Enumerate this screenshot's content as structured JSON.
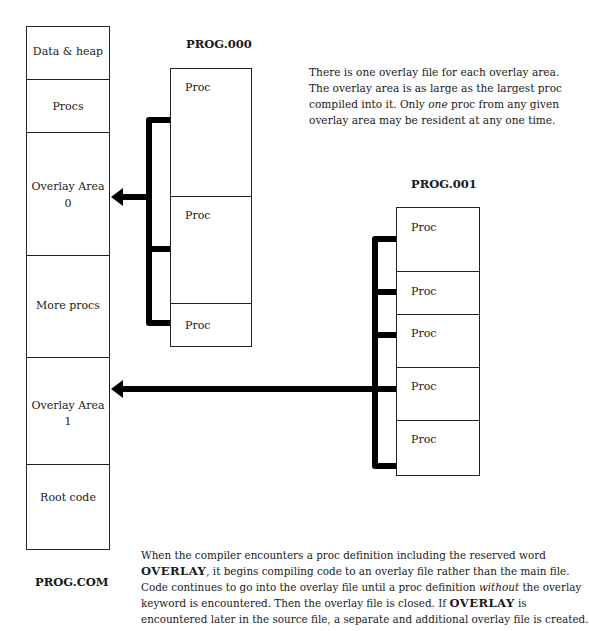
{
  "main_file": {
    "title": "PROG.COM",
    "segments": [
      {
        "label": "Data & heap"
      },
      {
        "label": "Procs"
      },
      {
        "label": "Overlay Area",
        "sub": "0"
      },
      {
        "label": "More procs"
      },
      {
        "label": "Overlay Area",
        "sub": "1"
      },
      {
        "label": "Root code"
      }
    ]
  },
  "overlay_files": [
    {
      "title": "PROG.000",
      "overlay_area": "0",
      "procs": [
        "Proc",
        "Proc",
        "Proc"
      ]
    },
    {
      "title": "PROG.001",
      "overlay_area": "1",
      "procs": [
        "Proc",
        "Proc",
        "Proc",
        "Proc",
        "Proc"
      ]
    }
  ],
  "note_top": {
    "lines": [
      "There is one overlay file for each overlay area.",
      "The overlay area is as large as the largest proc",
      "compiled into it.  Only ",
      "one",
      " proc from any given",
      "overlay area may be resident at any one time."
    ]
  },
  "note_bottom": {
    "l1": "When the compiler encounters a proc definition including  the reserved word",
    "l2_kw": "OVERLAY",
    "l2": ", it begins compiling code to an overlay file rather than the main file.",
    "l3a": "Code continues to go into the overlay file until a proc definition ",
    "l3_em": "without",
    "l3b": " the overlay",
    "l4a": "keyword is encountered.  Then the overlay file is closed.  If ",
    "l4_kw": "OVERLAY",
    "l4b": " is",
    "l5": "encountered later in the source file, a separate and additional overlay file is created."
  },
  "colors": {
    "line": "#000000",
    "border": "#222222",
    "background": "#ffffff"
  }
}
